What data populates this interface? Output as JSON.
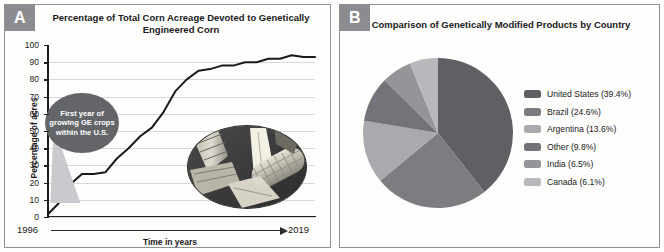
{
  "panels": {
    "a": {
      "badge": "A",
      "title": "Percentage of Total Corn Acreage Devoted to Genetically Engineered Corn",
      "callout": "First year of growing GE crops within the U.S.",
      "photo_alt": "corn-ears-photo"
    },
    "b": {
      "badge": "B",
      "title": "Comparison of Genetically Modified Products by Country"
    }
  },
  "chart_data": [
    {
      "type": "line",
      "title": "Percentage of Total Corn Acreage Devoted to Genetically Engineered Corn",
      "xlabel": "Time in years",
      "ylabel": "Percentage of acres",
      "xlim": [
        1996,
        2019
      ],
      "ylim": [
        0,
        100
      ],
      "yticks": [
        0,
        10,
        20,
        30,
        40,
        50,
        60,
        70,
        80,
        90,
        100
      ],
      "xticks": [
        "1996",
        "2019"
      ],
      "grid": true,
      "annotation": "First year of growing GE crops within the U.S.",
      "x": [
        1996,
        1997,
        1998,
        1999,
        2000,
        2001,
        2002,
        2003,
        2004,
        2005,
        2006,
        2007,
        2008,
        2009,
        2010,
        2011,
        2012,
        2013,
        2014,
        2015,
        2016,
        2017,
        2018,
        2019
      ],
      "values": [
        1,
        8,
        19,
        25,
        25,
        26,
        34,
        40,
        47,
        52,
        61,
        73,
        80,
        85,
        86,
        88,
        88,
        90,
        90,
        92,
        92,
        94,
        93,
        93
      ]
    },
    {
      "type": "pie",
      "title": "Comparison of Genetically Modified Products by Country",
      "start_angle": 0,
      "direction": "clockwise",
      "categories": [
        "United States",
        "Brazil",
        "Argentina",
        "Other",
        "India",
        "Canada"
      ],
      "values": [
        39.4,
        24.6,
        13.6,
        9.8,
        6.5,
        6.1
      ],
      "legend_position": "right",
      "legend": [
        {
          "label": "United States (39.4%)",
          "color": "#5e6064",
          "value": 39.4
        },
        {
          "label": "Brazil (24.6%)",
          "color": "#7b7d81",
          "value": 24.6
        },
        {
          "label": "Argentina (13.6%)",
          "color": "#a8aaad",
          "value": 13.6
        },
        {
          "label": "Other (9.8%)",
          "color": "#727479",
          "value": 9.8
        },
        {
          "label": "India (6.5%)",
          "color": "#939598",
          "value": 6.5
        },
        {
          "label": "Canada (6.1%)",
          "color": "#b6b8bb",
          "value": 6.1
        }
      ]
    }
  ],
  "axis_a": {
    "yticks": [
      "100",
      "90",
      "80",
      "70",
      "60",
      "50",
      "40",
      "30",
      "20",
      "10",
      "0"
    ],
    "year_start": "1996",
    "year_end": "2019",
    "xtitle": "Time in years",
    "ytitle": "Percentage of acres"
  }
}
